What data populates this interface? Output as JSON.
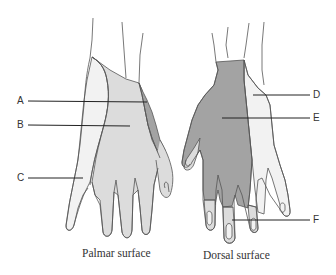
{
  "figure": {
    "captions": {
      "palmar": "Palmar surface",
      "dorsal": "Dorsal surface"
    },
    "labels": [
      {
        "id": "A",
        "text": "A",
        "side": "left",
        "hand": "palmar",
        "region": "dark-gray radial strip (palmar thumb base)"
      },
      {
        "id": "B",
        "text": "B",
        "side": "left",
        "hand": "palmar",
        "region": "medium-gray central palm"
      },
      {
        "id": "C",
        "text": "C",
        "side": "left",
        "hand": "palmar",
        "region": "light ulnar palm"
      },
      {
        "id": "D",
        "text": "D",
        "side": "right",
        "hand": "dorsal",
        "region": "light ulnar dorsum"
      },
      {
        "id": "E",
        "text": "E",
        "side": "right",
        "hand": "dorsal",
        "region": "dark-gray radial dorsum"
      },
      {
        "id": "F",
        "text": "F",
        "side": "right",
        "hand": "dorsal",
        "region": "medium-gray fingertips (dorsal)"
      }
    ],
    "colors": {
      "dark_region": "#a3a3a3",
      "medium_region": "#dcdcdc",
      "light_region": "#f2f2f2",
      "outline": "#555555",
      "leader_line": "#222222"
    }
  }
}
